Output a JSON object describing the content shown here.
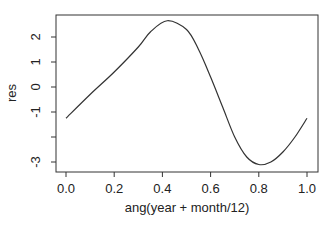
{
  "chart_data": {
    "type": "line",
    "title": "",
    "xlabel": "ang(year + month/12)",
    "ylabel": "res",
    "xlim": [
      0.0,
      1.0
    ],
    "ylim": [
      -3.2,
      2.9
    ],
    "grid": false,
    "legend": null,
    "x_ticks": [
      "0.0",
      "0.2",
      "0.4",
      "0.6",
      "0.8",
      "1.0"
    ],
    "y_ticks": [
      "-3",
      "-2",
      "-1",
      "0",
      "1",
      "2"
    ],
    "y_tick_labels_shown": [
      "-3",
      "-1",
      "0",
      "1",
      "2"
    ],
    "series": [
      {
        "name": "res",
        "color": "#333333",
        "x": [
          0.0,
          0.1,
          0.2,
          0.3,
          0.35,
          0.42,
          0.5,
          0.55,
          0.6,
          0.65,
          0.7,
          0.75,
          0.8,
          0.85,
          0.9,
          0.95,
          1.0
        ],
        "values": [
          -1.25,
          -0.3,
          0.6,
          1.6,
          2.2,
          2.65,
          2.3,
          1.5,
          0.4,
          -0.8,
          -2.0,
          -2.8,
          -3.1,
          -3.0,
          -2.6,
          -2.0,
          -1.25
        ]
      }
    ]
  }
}
